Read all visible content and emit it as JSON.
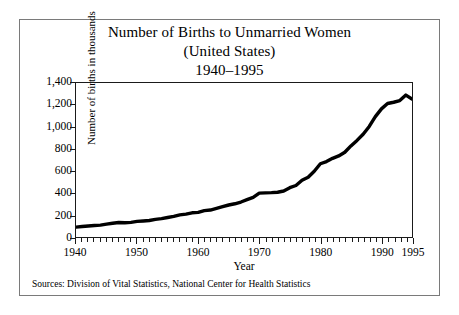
{
  "figure": {
    "title_lines": [
      "Number of Births to Unmarried Women",
      "(United States)",
      "1940–1995"
    ],
    "source_note": "Sources: Division of Vital Statistics, National Center for Health Statistics"
  },
  "chart_data": {
    "type": "line",
    "title": "Number of Births to Unmarried Women (United States) 1940–1995",
    "xlabel": "Year",
    "ylabel": "Number of births in thousands",
    "xlim": [
      1940,
      1995
    ],
    "ylim": [
      0,
      1400
    ],
    "grid": false,
    "legend": null,
    "x_ticks": [
      1940,
      1950,
      1960,
      1970,
      1980,
      1990,
      1995
    ],
    "x_tick_labels": [
      "1940",
      "1950",
      "1960",
      "1970",
      "1980",
      "1990",
      "1995"
    ],
    "x_minor_tick_step": 1,
    "y_ticks": [
      0,
      200,
      400,
      600,
      800,
      1000,
      1200,
      1400
    ],
    "y_tick_labels": [
      "0",
      "200",
      "400",
      "600",
      "800",
      "1,000",
      "1,200",
      "1,400"
    ],
    "line_color": "#000000",
    "line_width": 3.4,
    "x": [
      1940,
      1941,
      1942,
      1943,
      1944,
      1945,
      1946,
      1947,
      1948,
      1949,
      1950,
      1951,
      1952,
      1953,
      1954,
      1955,
      1956,
      1957,
      1958,
      1959,
      1960,
      1961,
      1962,
      1963,
      1964,
      1965,
      1966,
      1967,
      1968,
      1969,
      1970,
      1971,
      1972,
      1973,
      1974,
      1975,
      1976,
      1977,
      1978,
      1979,
      1980,
      1981,
      1982,
      1983,
      1984,
      1985,
      1986,
      1987,
      1988,
      1989,
      1990,
      1991,
      1992,
      1993,
      1994,
      1995
    ],
    "values": [
      90,
      95,
      100,
      105,
      108,
      117,
      125,
      132,
      130,
      133,
      142,
      146,
      150,
      160,
      167,
      177,
      187,
      201,
      208,
      220,
      224,
      240,
      245,
      260,
      276,
      291,
      302,
      318,
      339,
      360,
      399,
      401,
      403,
      407,
      418,
      448,
      468,
      516,
      544,
      598,
      666,
      686,
      715,
      737,
      770,
      828,
      878,
      934,
      1005,
      1094,
      1165,
      1214,
      1225,
      1240,
      1290,
      1254
    ]
  }
}
